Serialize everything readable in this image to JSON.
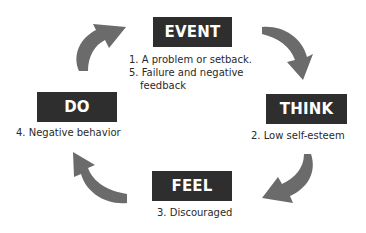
{
  "diagram": {
    "title": "",
    "type": "cycle",
    "colors": {
      "box_fill": "#2e2e2e",
      "box_text": "#ffffff",
      "arrow_fill": "#6b6b6b",
      "label_text": "#2a2a2a",
      "background": "#ffffff"
    },
    "nodes": [
      {
        "id": "event",
        "title": "EVENT",
        "lines": [
          "1. A problem or setback.",
          "5. Failure and negative",
          "feedback"
        ]
      },
      {
        "id": "think",
        "title": "THINK",
        "lines": [
          "2. Low self-esteem"
        ]
      },
      {
        "id": "feel",
        "title": "FEEL",
        "lines": [
          "3. Discouraged"
        ]
      },
      {
        "id": "do",
        "title": "DO",
        "lines": [
          "4. Negative behavior"
        ]
      }
    ],
    "arrows": [
      {
        "from": "event",
        "to": "think",
        "icon": "curved-arrow-icon"
      },
      {
        "from": "think",
        "to": "feel",
        "icon": "curved-arrow-icon"
      },
      {
        "from": "feel",
        "to": "do",
        "icon": "curved-arrow-icon"
      },
      {
        "from": "do",
        "to": "event",
        "icon": "curved-arrow-icon"
      }
    ]
  }
}
